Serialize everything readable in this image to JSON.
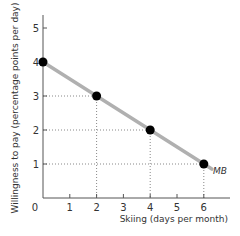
{
  "chart_data": {
    "type": "line",
    "title": "",
    "xlabel": "Skiing (days per month)",
    "ylabel": "Willingness to pay (percentage points per day)",
    "x_ticks": [
      "0",
      "1",
      "2",
      "3",
      "4",
      "5",
      "6"
    ],
    "y_ticks": [
      "1",
      "2",
      "3",
      "4",
      "5"
    ],
    "xlim": [
      0,
      7
    ],
    "ylim": [
      0,
      5.3
    ],
    "grid": false,
    "series": [
      {
        "name": "MB",
        "x": [
          0,
          2,
          4,
          6
        ],
        "y": [
          4,
          3,
          2,
          1
        ],
        "color": "#b0b0b0",
        "marker_color": "#000000"
      }
    ],
    "annotations": [
      {
        "text": "MB",
        "x": 6,
        "y": 1
      }
    ],
    "guide_lines": [
      {
        "x": 2,
        "y": 3
      },
      {
        "x": 4,
        "y": 2
      },
      {
        "x": 6,
        "y": 1
      }
    ]
  }
}
